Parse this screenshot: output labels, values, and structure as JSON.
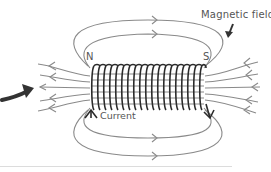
{
  "diagram": {
    "labels": {
      "magnetic_field": "Magnetic field",
      "north": "N",
      "south": "S",
      "current": "Current"
    },
    "colors": {
      "field_lines": "#8a8a8a",
      "coil": "#2b2b2b",
      "pointer_arrow": "#333333",
      "text": "#555555"
    },
    "coil": {
      "turns": 20
    }
  }
}
